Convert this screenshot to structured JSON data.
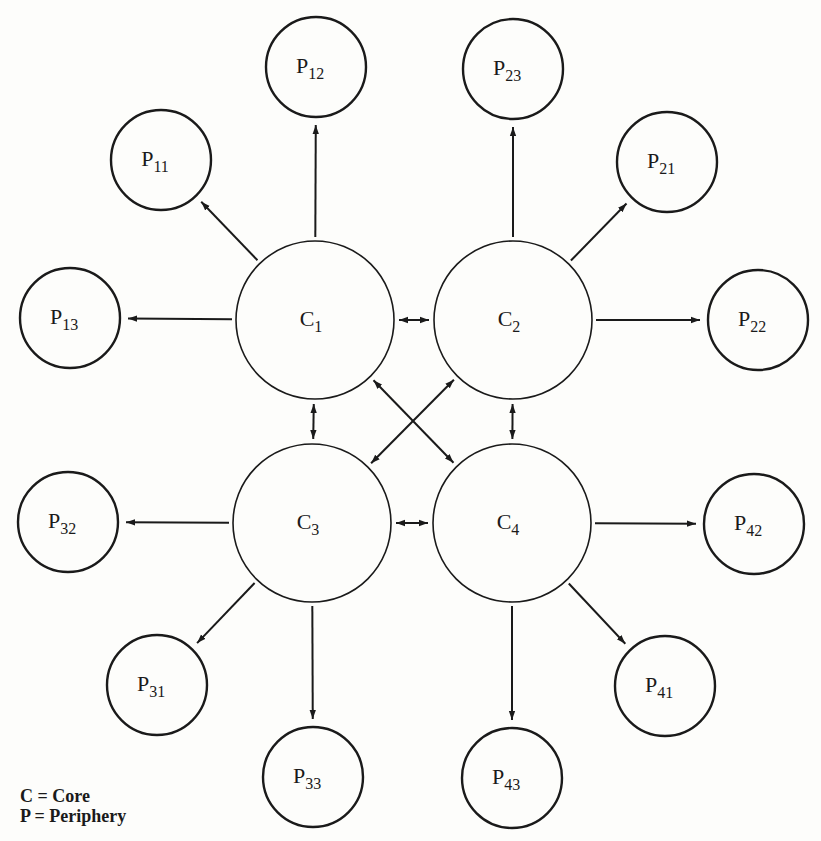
{
  "diagram": {
    "colors": {
      "stroke": "#1a1a1a",
      "background": "#fdfdfb"
    },
    "cores": [
      {
        "id": "C1",
        "base": "C",
        "sub": "1",
        "cx": 315,
        "cy": 320,
        "r": 79
      },
      {
        "id": "C2",
        "base": "C",
        "sub": "2",
        "cx": 513,
        "cy": 320,
        "r": 79
      },
      {
        "id": "C3",
        "base": "C",
        "sub": "3",
        "cx": 312,
        "cy": 523,
        "r": 79
      },
      {
        "id": "C4",
        "base": "C",
        "sub": "4",
        "cx": 512,
        "cy": 523,
        "r": 79
      }
    ],
    "peripheries": [
      {
        "id": "P11",
        "base": "P",
        "sub": "11",
        "cx": 161,
        "cy": 160,
        "r": 50,
        "core": "C1"
      },
      {
        "id": "P12",
        "base": "P",
        "sub": "12",
        "cx": 316,
        "cy": 67,
        "r": 50,
        "core": "C1"
      },
      {
        "id": "P13",
        "base": "P",
        "sub": "13",
        "cx": 70,
        "cy": 318,
        "r": 50,
        "core": "C1"
      },
      {
        "id": "P21",
        "base": "P",
        "sub": "21",
        "cx": 667,
        "cy": 162,
        "r": 50,
        "core": "C2"
      },
      {
        "id": "P22",
        "base": "P",
        "sub": "22",
        "cx": 758,
        "cy": 320,
        "r": 50,
        "core": "C2"
      },
      {
        "id": "P23",
        "base": "P",
        "sub": "23",
        "cx": 513,
        "cy": 69,
        "r": 50,
        "core": "C2"
      },
      {
        "id": "P31",
        "base": "P",
        "sub": "31",
        "cx": 157,
        "cy": 685,
        "r": 50,
        "core": "C3"
      },
      {
        "id": "P32",
        "base": "P",
        "sub": "32",
        "cx": 68,
        "cy": 522,
        "r": 50,
        "core": "C3"
      },
      {
        "id": "P33",
        "base": "P",
        "sub": "33",
        "cx": 313,
        "cy": 777,
        "r": 50,
        "core": "C3"
      },
      {
        "id": "P41",
        "base": "P",
        "sub": "41",
        "cx": 665,
        "cy": 686,
        "r": 50,
        "core": "C4"
      },
      {
        "id": "P42",
        "base": "P",
        "sub": "42",
        "cx": 754,
        "cy": 524,
        "r": 50,
        "core": "C4"
      },
      {
        "id": "P43",
        "base": "P",
        "sub": "43",
        "cx": 512,
        "cy": 778,
        "r": 50,
        "core": "C4"
      }
    ],
    "core_links": [
      {
        "from": "C1",
        "to": "C2",
        "bidirectional": true
      },
      {
        "from": "C1",
        "to": "C3",
        "bidirectional": true
      },
      {
        "from": "C2",
        "to": "C4",
        "bidirectional": true
      },
      {
        "from": "C3",
        "to": "C4",
        "bidirectional": true
      },
      {
        "from": "C1",
        "to": "C4",
        "bidirectional": true
      },
      {
        "from": "C2",
        "to": "C3",
        "bidirectional": true
      }
    ],
    "periphery_links_direction": "core-to-periphery"
  },
  "legend": {
    "core": "C = Core",
    "periphery": "P = Periphery"
  }
}
